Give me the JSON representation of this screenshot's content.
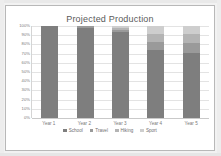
{
  "chart_data": {
    "type": "bar",
    "subtype": "100% stacked column",
    "title": "Projected Production",
    "xlabel": "",
    "ylabel": "",
    "ylim": [
      0,
      100
    ],
    "grid": true,
    "legend_position": "bottom",
    "categories": [
      "Year 1",
      "Year 2",
      "Year 3",
      "Year 4",
      "Year 5"
    ],
    "ytick_labels": [
      "100%",
      "90%",
      "80%",
      "70%",
      "60%",
      "50%",
      "40%",
      "30%",
      "20%",
      "10%",
      "0%"
    ],
    "ytick_values": [
      100,
      90,
      80,
      70,
      60,
      50,
      40,
      30,
      20,
      10,
      0
    ],
    "series": [
      {
        "name": "School",
        "color": "#7e7e7e",
        "values": [
          100,
          98,
          93,
          74,
          71
        ]
      },
      {
        "name": "Travel",
        "color": "#9a9a9a",
        "values": [
          0,
          2,
          3,
          9,
          11
        ]
      },
      {
        "name": "Hiking",
        "color": "#b4b4b4",
        "values": [
          0,
          0,
          2,
          8,
          9
        ]
      },
      {
        "name": "Sport",
        "color": "#cecece",
        "values": [
          0,
          0,
          2,
          9,
          9
        ]
      }
    ]
  },
  "legend": {
    "items": [
      {
        "label": "School",
        "color": "#7e7e7e"
      },
      {
        "label": "Travel",
        "color": "#9a9a9a"
      },
      {
        "label": "Hiking",
        "color": "#b4b4b4"
      },
      {
        "label": "Sport",
        "color": "#cecece"
      }
    ]
  },
  "colors": {
    "frame_border": "#b8b8b8",
    "plot_background": "#ffffff",
    "gridline": "#e3e3e3",
    "axis_text": "#7a7a7a",
    "title_text": "#5a5a5a",
    "page_background": "#f2f2f2"
  }
}
